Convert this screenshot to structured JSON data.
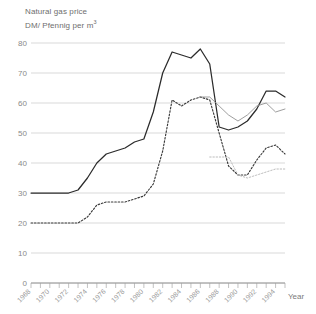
{
  "chart_data": {
    "type": "line",
    "title": "Natural gas price",
    "subtitle": "DM/ Pfennig per m³",
    "title_line1": "Natural gas price",
    "title_line2_prefix": "DM/ Pfennig per m",
    "title_line2_sup": "3",
    "xlabel": "Year",
    "ylabel": "",
    "ylim": [
      0,
      80
    ],
    "xlim": [
      1968,
      1995
    ],
    "grid": true,
    "legend": "none",
    "yticks": [
      0,
      10,
      20,
      30,
      40,
      50,
      60,
      70,
      80
    ],
    "ytick_labels": [
      "0",
      "10",
      "20",
      "30",
      "40",
      "50",
      "60",
      "70",
      "80"
    ],
    "xticks": [
      1968,
      1969,
      1970,
      1971,
      1972,
      1973,
      1974,
      1975,
      1976,
      1977,
      1978,
      1979,
      1980,
      1981,
      1982,
      1983,
      1984,
      1985,
      1986,
      1987,
      1988,
      1989,
      1990,
      1991,
      1992,
      1993,
      1994,
      1995
    ],
    "xtick_labels_shown": [
      "1968",
      "1970",
      "1972",
      "1974",
      "1976",
      "1978",
      "1980",
      "1982",
      "1984",
      "1986",
      "1988",
      "1990",
      "1992",
      "1994"
    ],
    "x": [
      1968,
      1969,
      1970,
      1971,
      1972,
      1973,
      1974,
      1975,
      1976,
      1977,
      1978,
      1979,
      1980,
      1981,
      1982,
      1983,
      1984,
      1985,
      1986,
      1987,
      1988,
      1989,
      1990,
      1991,
      1992,
      1993,
      1994,
      1995
    ],
    "series": [
      {
        "name": "Households (solid)",
        "style": "solid",
        "color": "#2b2b2b",
        "values": [
          30,
          30,
          30,
          30,
          30,
          31,
          35,
          40,
          43,
          44,
          45,
          47,
          48,
          57,
          70,
          77,
          76,
          75,
          78,
          73,
          52,
          51,
          52,
          54,
          58,
          64,
          64,
          62
        ]
      },
      {
        "name": "Industry (dotted)",
        "style": "dotted",
        "color": "#3a3a3a",
        "values": [
          20,
          20,
          20,
          20,
          20,
          20,
          22,
          26,
          27,
          27,
          27,
          28,
          29,
          33,
          44,
          61,
          59,
          61,
          62,
          61,
          50,
          39,
          36,
          36,
          41,
          45,
          46,
          43
        ]
      },
      {
        "name": "Secondary (thin solid)",
        "style": "thin",
        "color": "#8d8d8d",
        "values": [
          null,
          null,
          null,
          null,
          null,
          null,
          null,
          null,
          null,
          null,
          null,
          null,
          null,
          null,
          null,
          null,
          null,
          null,
          62,
          62,
          59,
          56,
          54,
          56,
          59,
          60,
          57,
          58
        ]
      },
      {
        "name": "Secondary (light dotted)",
        "style": "dotted-light",
        "color": "#b4b4b4",
        "values": [
          null,
          null,
          null,
          null,
          null,
          null,
          null,
          null,
          null,
          null,
          null,
          null,
          null,
          null,
          null,
          null,
          null,
          null,
          null,
          42,
          42,
          42,
          36,
          35,
          36,
          37,
          38,
          38
        ]
      }
    ]
  },
  "axis": {
    "year_label": "Year"
  }
}
